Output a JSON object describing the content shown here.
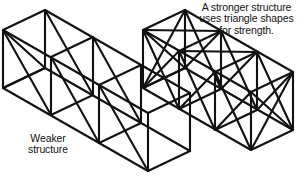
{
  "figure": {
    "type": "diagram",
    "subtype": "isometric-line-drawing",
    "background_color": "#ffffff",
    "line_color": "#111111",
    "text_color": "#111111"
  },
  "captions": {
    "weaker": "Weaker\nstructure",
    "stronger": "A stronger structure\nuses triangle shapes\nfor strength."
  },
  "structures": [
    {
      "id": "weaker-structure",
      "name": "weaker-structure",
      "label": "Weaker structure",
      "cells": 3,
      "braced": false,
      "description": "Open rectangular box frame with three cubic bays and no diagonal bracing."
    },
    {
      "id": "stronger-structure",
      "name": "stronger-structure",
      "label": "A stronger structure uses triangle shapes for strength.",
      "cells": 3,
      "braced": true,
      "description": "Rectangular box frame with three cubic bays, each face cross-braced with X diagonals forming triangles."
    }
  ]
}
